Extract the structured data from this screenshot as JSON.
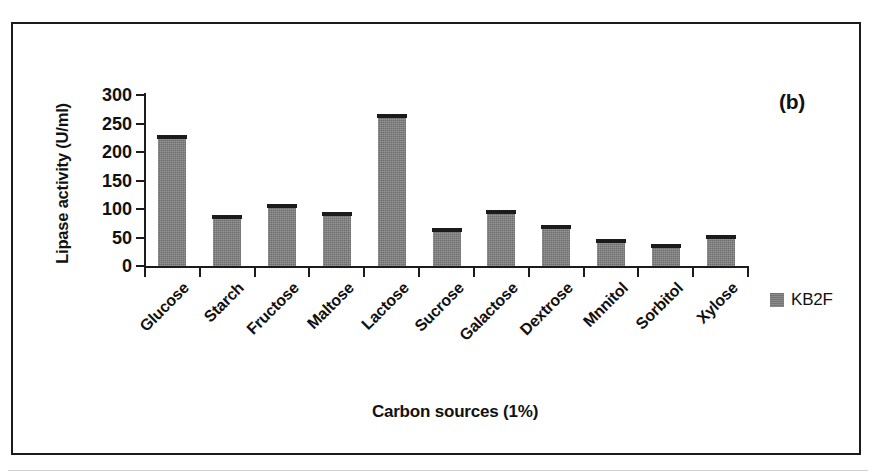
{
  "panel": {
    "letter": "(b)"
  },
  "legend": {
    "series_label": "KB2F",
    "swatch_color": "#7c7c7c"
  },
  "chart_data": {
    "type": "bar",
    "title": "",
    "panel_letter": "(b)",
    "xlabel": "Carbon sources (1%)",
    "ylabel": "Lipase activity (U/ml)",
    "ylim": [
      0,
      300
    ],
    "yticks": [
      0,
      50,
      100,
      150,
      200,
      250,
      300
    ],
    "ytick_labels": [
      "0",
      "50",
      "100",
      "150",
      "200",
      "250",
      "300"
    ],
    "grid": false,
    "legend_position": "right",
    "bar_color": "#7c7c7c",
    "error_bars": true,
    "categories": [
      "Glucose",
      "Starch",
      "Fructose",
      "Maltose",
      "Lactose",
      "Sucrose",
      "Galactose",
      "Dextrose",
      "Mnnitol",
      "Sorbitol",
      "Xylose"
    ],
    "series": [
      {
        "name": "KB2F",
        "values": [
          225,
          85,
          103,
          90,
          262,
          62,
          93,
          67,
          43,
          33,
          49
        ]
      }
    ]
  }
}
